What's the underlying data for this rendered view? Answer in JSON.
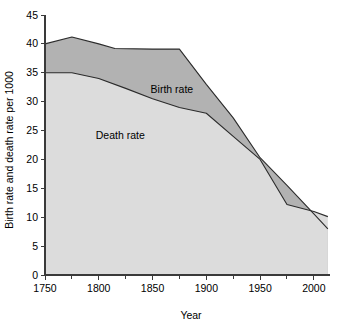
{
  "chart_data": {
    "type": "area",
    "title": "",
    "xlabel": "Year",
    "ylabel": "Birth rate and death rate per 1000",
    "xlim": [
      1750,
      2015
    ],
    "ylim": [
      0,
      45
    ],
    "grid": false,
    "legend_position": "inline-annotation",
    "x_ticks_major": [
      1750,
      1800,
      1850,
      1900,
      1950,
      2000
    ],
    "x_ticks_minor": [
      1775,
      1825,
      1875,
      1925,
      1975
    ],
    "y_ticks": [
      0,
      5,
      10,
      15,
      20,
      25,
      30,
      35,
      40,
      45
    ],
    "x_tick_labels": [
      "1750",
      "1800",
      "1850",
      "1900",
      "1950",
      "2000"
    ],
    "y_tick_labels": [
      "0",
      "5",
      "10",
      "15",
      "20",
      "25",
      "30",
      "35",
      "40",
      "45"
    ],
    "annotations": [
      {
        "text": "Birth rate",
        "x": 1868,
        "y": 31.5
      },
      {
        "text": "Death rate",
        "x": 1820,
        "y": 23.5
      }
    ],
    "series": [
      {
        "name": "Birth rate",
        "color": "#b2b2b2",
        "line_color": "#2b2b2b",
        "x": [
          1750,
          1775,
          1800,
          1815,
          1850,
          1875,
          1900,
          1925,
          1950,
          1975,
          2000,
          2013
        ],
        "values": [
          40.0,
          41.2,
          40.0,
          39.2,
          39.1,
          39.1,
          33.0,
          27.2,
          20.3,
          15.5,
          10.6,
          8.0
        ]
      },
      {
        "name": "Death rate",
        "color": "#dcdcdc",
        "line_color": "#2b2b2b",
        "x": [
          1750,
          1775,
          1800,
          1825,
          1850,
          1875,
          1900,
          1925,
          1950,
          1975,
          2000,
          2013
        ],
        "values": [
          35.0,
          35.0,
          34.0,
          32.3,
          30.5,
          29.0,
          28.0,
          24.0,
          20.0,
          12.2,
          11.0,
          10.1
        ]
      }
    ]
  }
}
